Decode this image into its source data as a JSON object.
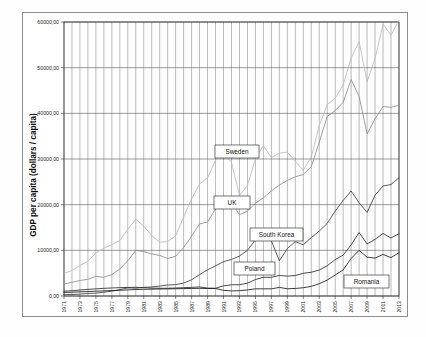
{
  "chart_data": {
    "type": "line",
    "title": "",
    "xlabel": "",
    "ylabel": "GDP per capita (dollars / capita)",
    "ylim": [
      0,
      60000
    ],
    "xlim": [
      1971,
      2013
    ],
    "grid": "both",
    "legend_position": "inline-callouts",
    "y_ticks": [
      "0,00",
      "10000,00",
      "20000,00",
      "30000,00",
      "40000,00",
      "50000,00",
      "60000,00"
    ],
    "y_tick_values": [
      0,
      10000,
      20000,
      30000,
      40000,
      50000,
      60000
    ],
    "x_tick_labels": [
      "1971",
      "1973",
      "1975",
      "1977",
      "1979",
      "1981",
      "1983",
      "1985",
      "1987",
      "1989",
      "1991",
      "1993",
      "1995",
      "1997",
      "1999",
      "2001",
      "2003",
      "2005",
      "2007",
      "2009",
      "2011",
      "2013"
    ],
    "x": [
      1971,
      1972,
      1973,
      1974,
      1975,
      1976,
      1977,
      1978,
      1979,
      1980,
      1981,
      1982,
      1983,
      1984,
      1985,
      1986,
      1987,
      1988,
      1989,
      1990,
      1991,
      1992,
      1993,
      1994,
      1995,
      1996,
      1997,
      1998,
      1999,
      2000,
      2001,
      2002,
      2003,
      2004,
      2005,
      2006,
      2007,
      2008,
      2009,
      2010,
      2011,
      2012,
      2013
    ],
    "series": [
      {
        "name": "Sweden",
        "color": "#b9b9b9",
        "values": [
          4900,
          5600,
          6700,
          7600,
          9400,
          10500,
          11200,
          12200,
          14600,
          16800,
          15300,
          13200,
          11800,
          11900,
          13200,
          17300,
          21300,
          24500,
          25900,
          29700,
          31000,
          29300,
          22000,
          24200,
          30100,
          32900,
          30300,
          31300,
          31500,
          29500,
          27500,
          30500,
          37300,
          41900,
          43300,
          46200,
          52100,
          55700,
          46900,
          52000,
          59500,
          57100,
          60400
        ],
        "style": "solid"
      },
      {
        "name": "UK",
        "color": "#8c8c8c",
        "values": [
          2650,
          3000,
          3400,
          3650,
          4300,
          4100,
          4700,
          5900,
          7700,
          10000,
          9700,
          9200,
          8900,
          8200,
          8700,
          10600,
          13100,
          15800,
          16200,
          19100,
          19600,
          20500,
          17800,
          18600,
          20300,
          21500,
          23000,
          24300,
          25300,
          26100,
          26600,
          28300,
          33700,
          39300,
          40600,
          42400,
          47400,
          43700,
          35500,
          38800,
          41500,
          41300,
          41800
        ],
        "style": "solid"
      },
      {
        "name": "South Korea",
        "color": "#3f3f3f",
        "values": [
          301,
          323,
          406,
          563,
          617,
          834,
          1050,
          1400,
          1780,
          1700,
          1880,
          1980,
          2180,
          2410,
          2480,
          2830,
          3550,
          4690,
          5740,
          6610,
          7520,
          8000,
          8740,
          10000,
          12300,
          13200,
          12100,
          7700,
          10400,
          11900,
          11200,
          12800,
          14200,
          15900,
          18600,
          20900,
          23000,
          20400,
          18300,
          22100,
          24100,
          24400,
          25900
        ],
        "style": "solid"
      },
      {
        "name": "Poland",
        "color": "#2b2b2b",
        "values": [
          1080,
          1150,
          1300,
          1450,
          1560,
          1680,
          1760,
          1830,
          1870,
          1900,
          1820,
          1730,
          1690,
          1700,
          1750,
          1820,
          1900,
          1980,
          1730,
          1690,
          2230,
          2460,
          2470,
          2810,
          3600,
          4100,
          4080,
          4500,
          4350,
          4480,
          4980,
          5200,
          5680,
          6620,
          7970,
          8950,
          11200,
          13900,
          11400,
          12400,
          13700,
          12700,
          13650
        ],
        "style": "solid"
      },
      {
        "name": "Romania",
        "color": "#1a1a1a",
        "values": [
          780,
          830,
          900,
          980,
          1050,
          1120,
          1190,
          1260,
          1330,
          1410,
          1460,
          1500,
          1530,
          1560,
          1590,
          1620,
          1650,
          1680,
          1640,
          1650,
          1240,
          1110,
          1160,
          1330,
          1570,
          1570,
          1570,
          1880,
          1590,
          1650,
          1810,
          2100,
          2690,
          3480,
          4600,
          5710,
          8230,
          10000,
          8500,
          8300,
          9100,
          8400,
          9500
        ],
        "style": "solid"
      }
    ],
    "callouts": [
      {
        "label": "Sweden",
        "x": 215,
        "y": 145,
        "w": 44,
        "h": 13
      },
      {
        "label": "UK",
        "x": 214,
        "y": 196,
        "w": 36,
        "h": 13
      },
      {
        "label": "South Korea",
        "x": 250,
        "y": 228,
        "w": 53,
        "h": 13
      },
      {
        "label": "Poland",
        "x": 234,
        "y": 262,
        "w": 41,
        "h": 13
      },
      {
        "label": "Romania",
        "x": 344,
        "y": 275,
        "w": 45,
        "h": 13
      }
    ]
  }
}
